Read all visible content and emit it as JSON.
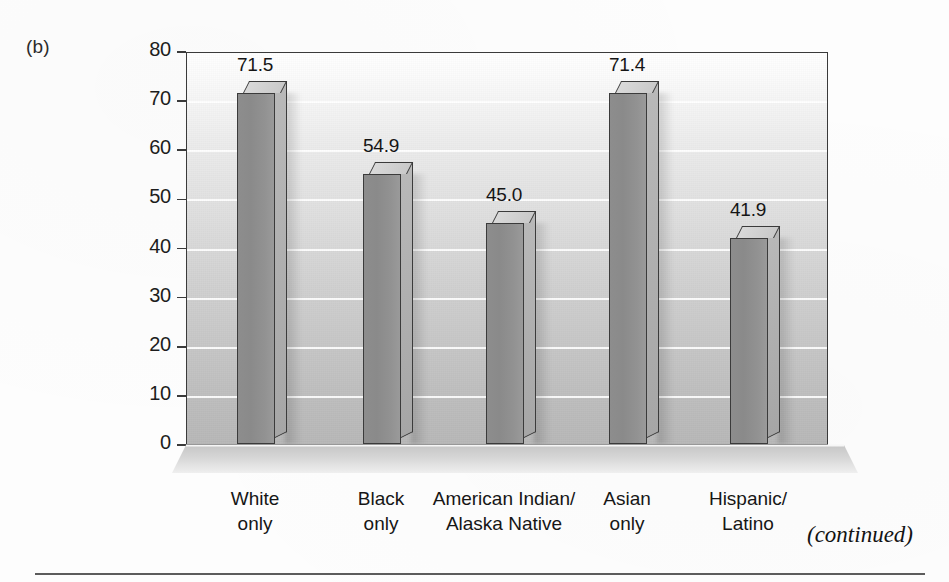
{
  "figure": {
    "panel_letter": "(b)",
    "continued_note": "(continued)"
  },
  "chart_data": {
    "type": "bar",
    "title": "",
    "subtitle": "",
    "xlabel": "",
    "ylabel": "Percentage of Population",
    "ylim": [
      0,
      80
    ],
    "y_ticks": [
      0,
      10,
      20,
      30,
      40,
      50,
      60,
      70,
      80
    ],
    "y_tick_labels": [
      "0",
      "10",
      "20",
      "30",
      "40",
      "50",
      "60",
      "70",
      "80"
    ],
    "grid": true,
    "legend": "none",
    "categories": [
      "White\nonly",
      "Black\nonly",
      "American Indian/\nAlaska Native",
      "Asian\nonly",
      "Hispanic/\nLatino"
    ],
    "category_lines": [
      [
        "White",
        "only"
      ],
      [
        "Black",
        "only"
      ],
      [
        "American Indian/",
        "Alaska Native"
      ],
      [
        "Asian",
        "only"
      ],
      [
        "Hispanic/",
        "Latino"
      ]
    ],
    "values": [
      71.5,
      54.9,
      45.0,
      71.4,
      41.9
    ],
    "value_labels": [
      "71.5",
      "54.9",
      "45.0",
      "71.4",
      "41.9"
    ],
    "bar_style": "3d-column",
    "colors": {
      "bar_front": "#8d8d8d",
      "bar_top": "#d4d4d4",
      "bar_side": "#b0b0b0",
      "bar_outline": "#3b3b3b",
      "gridline": "#ffffff",
      "plot_top": "#ffffff",
      "plot_bottom": "#b8b8b8",
      "axis": "#3a3a3a",
      "text": "#161616"
    }
  }
}
